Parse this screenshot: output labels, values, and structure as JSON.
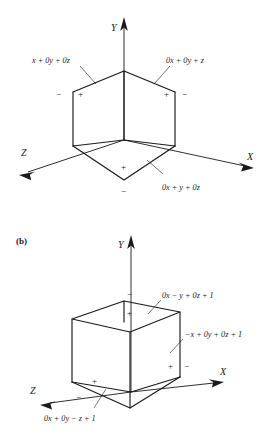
{
  "figure_a": {
    "name": "figure-a-unit-cube-planes",
    "axes": [
      {
        "id": "y",
        "label": "Y"
      },
      {
        "id": "x",
        "label": "X"
      },
      {
        "id": "z",
        "label": "Z"
      }
    ],
    "plane_labels": [
      {
        "id": "left-plane",
        "text": "x + 0y + 0z"
      },
      {
        "id": "right-plane",
        "text": "0x + 0y + z"
      },
      {
        "id": "bottom-plane",
        "text": "0x + y + 0z"
      }
    ],
    "signs": [
      {
        "id": "left-outer",
        "text": "−"
      },
      {
        "id": "left-inner",
        "text": "+"
      },
      {
        "id": "right-inner",
        "text": "+"
      },
      {
        "id": "right-outer",
        "text": "−"
      },
      {
        "id": "bottom-inner",
        "text": "+"
      },
      {
        "id": "bottom-outer",
        "text": "−"
      }
    ]
  },
  "figure_b": {
    "name": "figure-b-unit-cube-planes",
    "panel_tag": "(b)",
    "axes": [
      {
        "id": "y",
        "label": "Y"
      },
      {
        "id": "x",
        "label": "X"
      },
      {
        "id": "z",
        "label": "Z"
      }
    ],
    "plane_labels": [
      {
        "id": "top-plane",
        "text": "0x − y + 0z + 1"
      },
      {
        "id": "right-plane",
        "text": "−x + 0y + 0z + 1"
      },
      {
        "id": "front-plane",
        "text": "0x + 0y − z + 1"
      }
    ],
    "signs": [
      {
        "id": "top-outer",
        "text": "−"
      },
      {
        "id": "top-inner",
        "text": "+"
      },
      {
        "id": "right-inner",
        "text": "+"
      },
      {
        "id": "right-outer",
        "text": "−"
      },
      {
        "id": "front-inner",
        "text": "+"
      },
      {
        "id": "front-outer",
        "text": "−"
      }
    ]
  },
  "colors": {
    "ink": "#1a1a1a",
    "background": "#ffffff"
  }
}
